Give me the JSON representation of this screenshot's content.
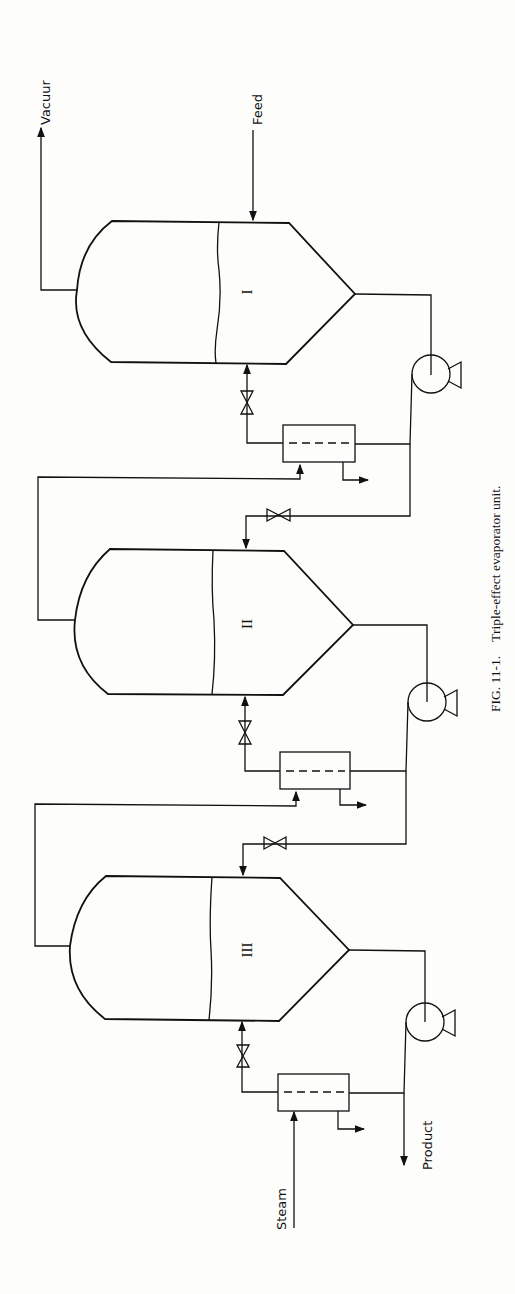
{
  "figure": {
    "caption_number": "FIG. 11-1.",
    "caption_text": "Triple-effect evaporator unit.",
    "orientation": "rotated 90° counter-clockwise"
  },
  "streams": {
    "vacuum": "Vacuur",
    "feed": "Feed",
    "steam": "Steam",
    "product": "Product"
  },
  "effects": [
    {
      "label": "I"
    },
    {
      "label": "II"
    },
    {
      "label": "III"
    }
  ],
  "colors": {
    "ink": "#111111",
    "paper": "#fdfdfb"
  }
}
